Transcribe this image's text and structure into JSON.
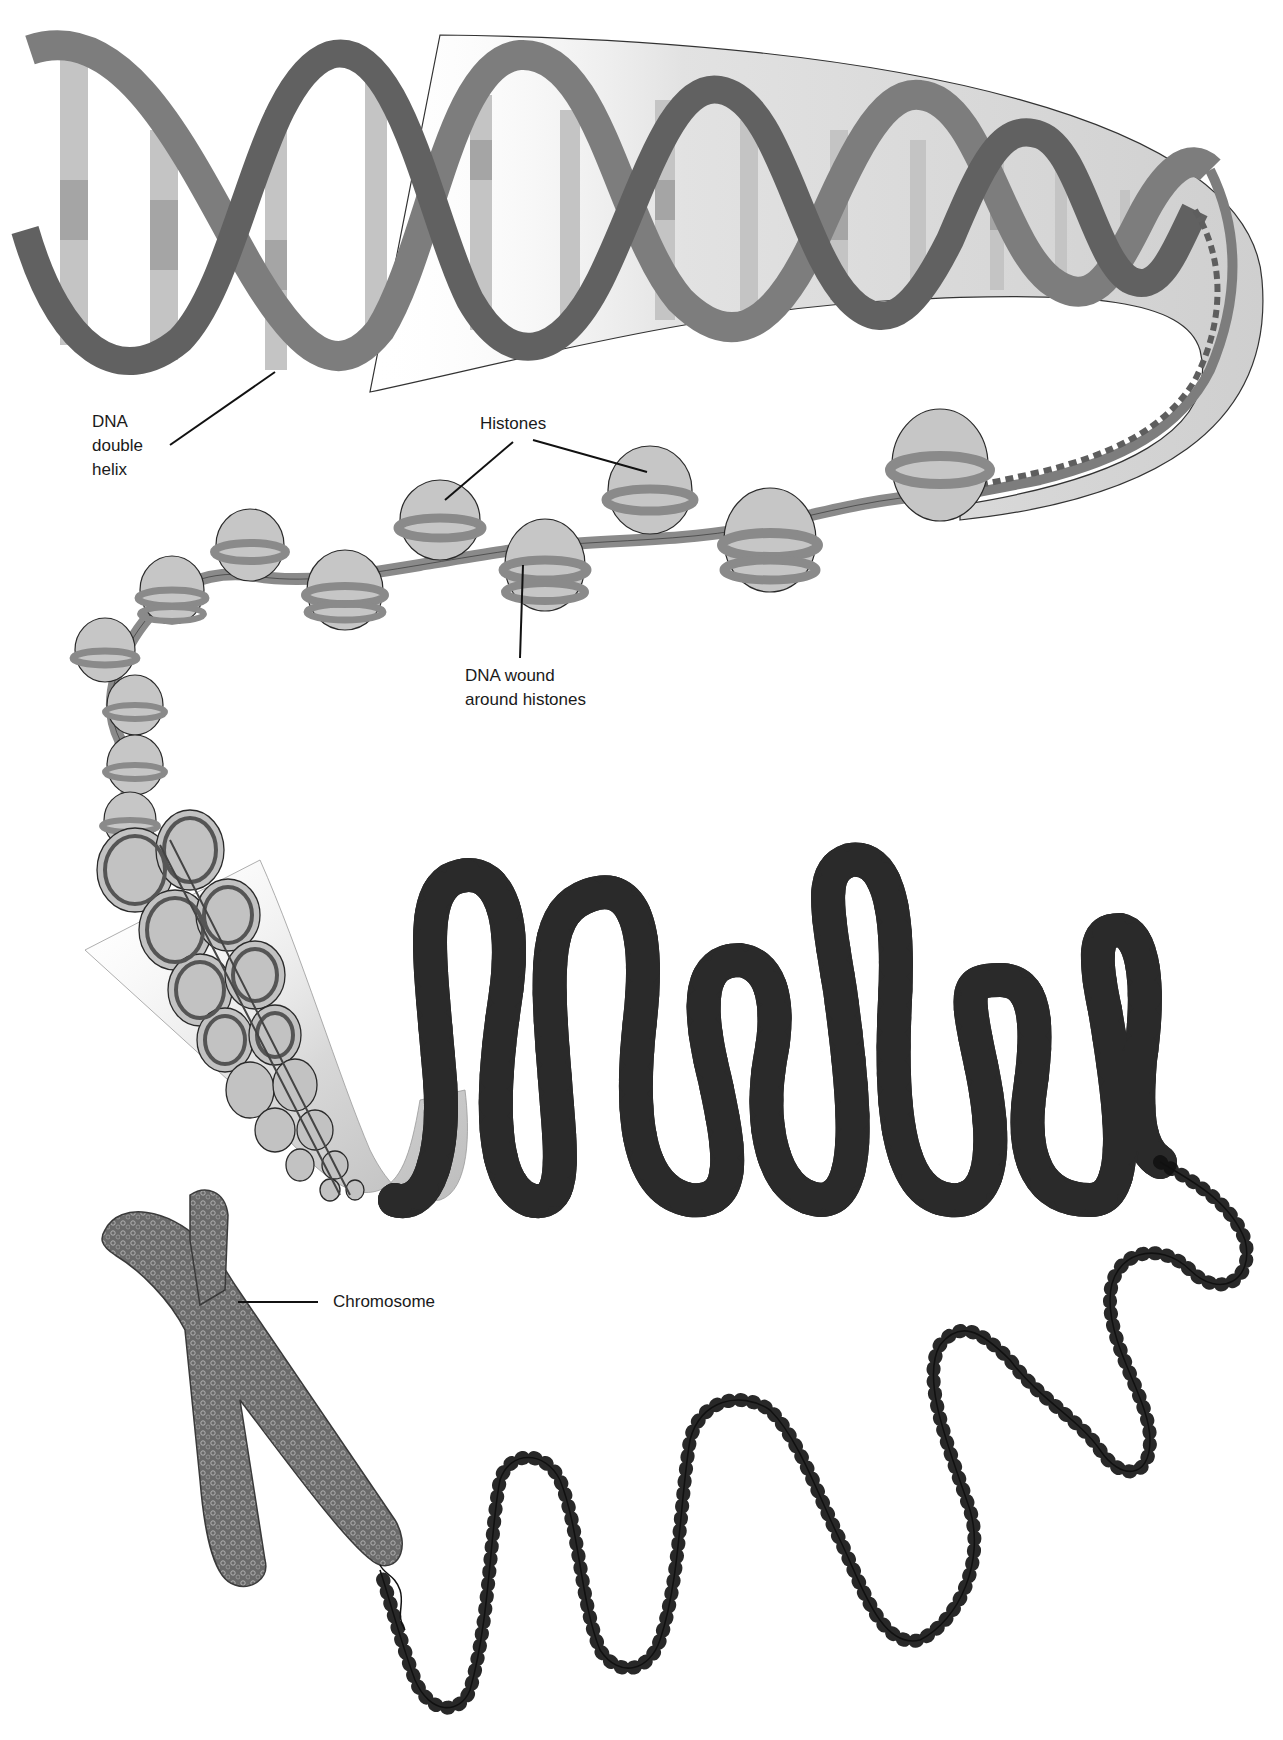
{
  "diagram": {
    "labels": {
      "dna_double_helix": [
        "DNA",
        "double",
        "helix"
      ],
      "histones": "Histones",
      "dna_wound": [
        "DNA wound",
        "around histones"
      ],
      "chromosome": "Chromosome"
    },
    "stages": [
      "DNA double helix",
      "Nucleosomes (DNA wound around histones)",
      "Chromatin fiber",
      "Looped fiber",
      "Coiled fiber",
      "Chromosome"
    ],
    "colors": {
      "helix_backbone": "#7a7a7a",
      "helix_backbone_dark": "#5e5e5e",
      "base_pairs_light": "#c8c8c8",
      "base_pairs_mid": "#a9a9a9",
      "callout_fill": "#d6d6d6",
      "histone_fill": "#c4c4c4",
      "dna_strand": "#8e8e8e",
      "outline": "#2a2a2a",
      "chromosome": "#5a5a5a",
      "label_text": "#1a1a1a"
    }
  }
}
